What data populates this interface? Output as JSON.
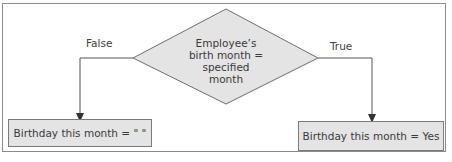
{
  "diagram": {
    "type": "flowchart-decision",
    "decision": {
      "lines": [
        "Employee’s",
        "birth month = specified",
        "month"
      ],
      "shape": "diamond",
      "fill": "#e4e4e4"
    },
    "branches": {
      "false": {
        "label": "False",
        "result": "Birthday this month = \" \""
      },
      "true": {
        "label": "True",
        "result": "Birthday this month = Yes"
      }
    },
    "colors": {
      "frame": "#8a8a8a",
      "line": "#555555",
      "box_fill": "#e4e4e4",
      "box_border": "#7a7a7a",
      "text": "#3a3a3a"
    }
  }
}
